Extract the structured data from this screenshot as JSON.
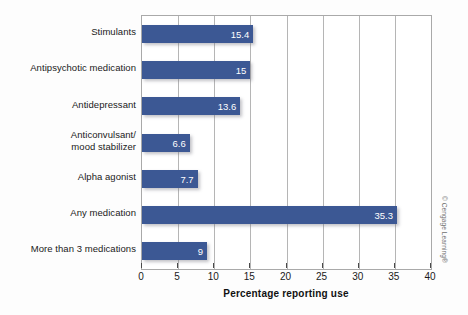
{
  "chart_data": {
    "type": "bar",
    "orientation": "horizontal",
    "title": "",
    "xlabel": "Percentage reporting use",
    "ylabel": "",
    "xlim": [
      0,
      40
    ],
    "xticks": [
      0,
      5,
      10,
      15,
      20,
      25,
      30,
      35,
      40
    ],
    "xtick_labels": [
      "0",
      "5",
      "10",
      "15",
      "20",
      "25",
      "30",
      "35",
      "40"
    ],
    "grid": true,
    "grid_axis": "x",
    "legend": false,
    "categories": [
      "Stimulants",
      "Antipsychotic medication",
      "Antidepressant",
      "Anticonvulsant/ mood stabilizer",
      "Alpha agonist",
      "Any medication",
      "More than 3 medications"
    ],
    "category_lines": [
      [
        "Stimulants"
      ],
      [
        "Antipsychotic medication"
      ],
      [
        "Antidepressant"
      ],
      [
        "Anticonvulsant/",
        "mood stabilizer"
      ],
      [
        "Alpha agonist"
      ],
      [
        "Any medication"
      ],
      [
        "More than 3 medications"
      ]
    ],
    "values": [
      15.4,
      15,
      13.6,
      6.6,
      7.7,
      35.3,
      9
    ],
    "value_labels": [
      "15.4",
      "15",
      "13.6",
      "6.6",
      "7.7",
      "35.3",
      "9"
    ],
    "bar_color": "#3c5894",
    "value_label_color": "#ffffff",
    "plot_background": "#ffffff",
    "grid_color": "#b5b5b5",
    "axis_color": "#a9a9a9"
  },
  "credit": {
    "text": "© Cengage Learning®"
  }
}
